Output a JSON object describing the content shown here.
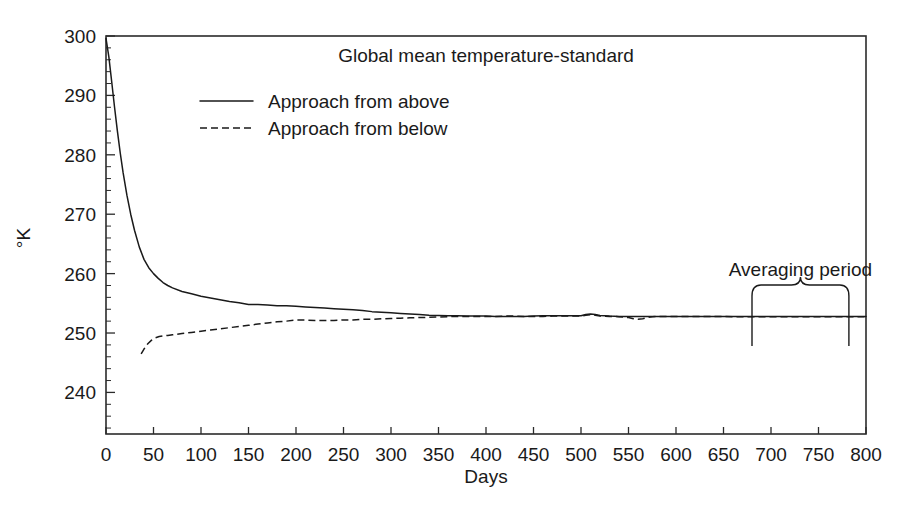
{
  "chart_data": {
    "type": "line",
    "title": "Global mean temperature-standard",
    "xlabel": "Days",
    "ylabel": "°K",
    "xlim": [
      0,
      800
    ],
    "ylim": [
      233,
      300
    ],
    "grid": false,
    "legend_position": "top-left-inside",
    "xticks": [
      0,
      50,
      100,
      150,
      200,
      250,
      300,
      350,
      400,
      450,
      500,
      550,
      600,
      650,
      700,
      750,
      800
    ],
    "xticklabels": [
      "0",
      "50",
      "100",
      "150",
      "200",
      "250",
      "300",
      "350",
      "400",
      "450",
      "500",
      "550",
      "600",
      "650",
      "700",
      "750",
      "800"
    ],
    "yticks": [
      240,
      250,
      260,
      270,
      280,
      290,
      300
    ],
    "yticklabels": [
      "240",
      "250",
      "260",
      "270",
      "280",
      "290",
      "300"
    ],
    "y_minor_tick_step": 2,
    "series": [
      {
        "name": "Approach from above",
        "style": "solid",
        "x": [
          0,
          3,
          6,
          9,
          12,
          15,
          18,
          22,
          26,
          30,
          35,
          40,
          45,
          50,
          55,
          60,
          65,
          70,
          80,
          90,
          100,
          110,
          120,
          130,
          140,
          150,
          160,
          170,
          180,
          190,
          200,
          210,
          220,
          230,
          240,
          250,
          260,
          270,
          280,
          290,
          300,
          310,
          320,
          330,
          340,
          350,
          360,
          370,
          380,
          390,
          400,
          410,
          420,
          430,
          440,
          450,
          460,
          470,
          480,
          490,
          500,
          505,
          510,
          515,
          520,
          530,
          540,
          550,
          560,
          570,
          580,
          590,
          600,
          610,
          620,
          630,
          640,
          650,
          660,
          670,
          680,
          690,
          700,
          710,
          720,
          730,
          740,
          750,
          760,
          770,
          780,
          790,
          800
        ],
        "y": [
          299.6,
          296.5,
          292.3,
          288.0,
          284.0,
          280.3,
          277.0,
          273.2,
          270.0,
          267.3,
          264.5,
          262.4,
          261.0,
          260.0,
          259.2,
          258.5,
          258.0,
          257.6,
          257.0,
          256.6,
          256.2,
          255.9,
          255.6,
          255.3,
          255.1,
          254.8,
          254.8,
          254.7,
          254.6,
          254.6,
          254.5,
          254.4,
          254.3,
          254.2,
          254.1,
          254.0,
          253.9,
          253.8,
          253.6,
          253.5,
          253.4,
          253.3,
          253.2,
          253.1,
          253.0,
          252.95,
          252.9,
          252.9,
          252.85,
          252.85,
          252.85,
          252.8,
          252.8,
          252.8,
          252.8,
          252.85,
          252.9,
          252.9,
          252.9,
          252.9,
          252.9,
          253.1,
          253.2,
          253.1,
          252.95,
          252.85,
          252.8,
          252.8,
          252.8,
          252.8,
          252.8,
          252.8,
          252.8,
          252.8,
          252.8,
          252.8,
          252.8,
          252.8,
          252.8,
          252.8,
          252.8,
          252.8,
          252.8,
          252.8,
          252.8,
          252.8,
          252.8,
          252.8,
          252.8,
          252.8,
          252.8,
          252.8,
          252.8
        ],
        "comment_start_value": 299.6
      },
      {
        "name": "Approach from below",
        "style": "dashed",
        "x": [
          37,
          40,
          44,
          48,
          52,
          56,
          60,
          65,
          70,
          80,
          90,
          100,
          110,
          120,
          130,
          140,
          150,
          160,
          170,
          180,
          190,
          200,
          210,
          220,
          230,
          240,
          250,
          260,
          270,
          280,
          290,
          300,
          310,
          320,
          330,
          340,
          350,
          360,
          370,
          380,
          390,
          400,
          410,
          420,
          430,
          440,
          450,
          460,
          470,
          480,
          490,
          500,
          505,
          510,
          515,
          520,
          530,
          540,
          550,
          555,
          560,
          565,
          570,
          575,
          580,
          590,
          600,
          610,
          620,
          630,
          640,
          650,
          660,
          670,
          680,
          690,
          700,
          710,
          720,
          730,
          740,
          750,
          760,
          770,
          780,
          790,
          800
        ],
        "y": [
          246.5,
          247.3,
          248.2,
          248.8,
          249.2,
          249.4,
          249.5,
          249.6,
          249.7,
          249.9,
          250.1,
          250.3,
          250.5,
          250.7,
          250.9,
          251.1,
          251.3,
          251.5,
          251.7,
          251.9,
          252.0,
          252.2,
          252.2,
          252.1,
          252.1,
          252.1,
          252.2,
          252.2,
          252.3,
          252.3,
          252.4,
          252.45,
          252.5,
          252.55,
          252.6,
          252.65,
          252.7,
          252.75,
          252.8,
          252.8,
          252.8,
          252.8,
          252.8,
          252.85,
          252.85,
          252.8,
          252.8,
          252.8,
          252.85,
          252.85,
          252.85,
          252.85,
          253.0,
          253.1,
          253.0,
          252.85,
          252.8,
          252.75,
          252.6,
          252.4,
          252.3,
          252.4,
          252.6,
          252.75,
          252.8,
          252.8,
          252.8,
          252.8,
          252.8,
          252.8,
          252.8,
          252.8,
          252.75,
          252.75,
          252.75,
          252.75,
          252.75,
          252.75,
          252.75,
          252.75,
          252.75,
          252.75,
          252.75,
          252.75,
          252.75,
          252.75,
          252.75
        ],
        "comment_start_day": 37
      }
    ],
    "annotations": [
      {
        "text": "Averaging period",
        "type": "brace-with-markers",
        "x_start": 680,
        "x_end": 782
      }
    ]
  },
  "legend": {
    "entries": [
      {
        "label": "Approach from above",
        "style": "solid"
      },
      {
        "label": "Approach from below",
        "style": "dashed"
      }
    ]
  }
}
